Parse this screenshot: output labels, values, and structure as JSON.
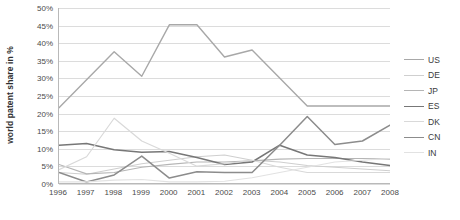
{
  "chart_data": {
    "type": "line",
    "title": "",
    "xlabel": "",
    "ylabel": "world patent share in %",
    "x": [
      1996,
      1997,
      1998,
      1999,
      2000,
      2001,
      2002,
      2003,
      2004,
      2005,
      2006,
      2007,
      2008
    ],
    "categories": [
      "1996",
      "1997",
      "1998",
      "1999",
      "2000",
      "2001",
      "2002",
      "2003",
      "2004",
      "2005",
      "2006",
      "2007",
      "2008"
    ],
    "ylim": [
      0,
      50
    ],
    "yticks": [
      0,
      5,
      10,
      15,
      20,
      25,
      30,
      35,
      40,
      45,
      50
    ],
    "ytick_labels": [
      "0%",
      "5%",
      "10%",
      "15%",
      "20%",
      "25%",
      "30%",
      "35%",
      "40%",
      "45%",
      "50%"
    ],
    "grid": true,
    "legend_position": "right",
    "series": [
      {
        "name": "US",
        "color": "#a8a8a8",
        "width": 1.4,
        "values": [
          21.5,
          29.5,
          37.5,
          30.5,
          45.2,
          45.2,
          36.0,
          38.0,
          30.0,
          22.0,
          22.0,
          22.0,
          22.0
        ]
      },
      {
        "name": "DE",
        "color": "#cfcfcf",
        "width": 1.2,
        "values": [
          3.0,
          2.5,
          4.0,
          5.5,
          6.5,
          7.5,
          8.0,
          6.5,
          6.0,
          5.0,
          4.5,
          4.0,
          3.5
        ]
      },
      {
        "name": "JP",
        "color": "#b5b5b5",
        "width": 1.2,
        "values": [
          5.3,
          2.6,
          3.0,
          4.5,
          5.3,
          6.0,
          6.0,
          6.3,
          6.8,
          7.0,
          7.0,
          7.0,
          6.8
        ]
      },
      {
        "name": "ES",
        "color": "#777777",
        "width": 1.5,
        "values": [
          10.8,
          11.3,
          9.5,
          8.8,
          9.0,
          7.3,
          5.3,
          6.0,
          10.8,
          8.0,
          7.3,
          6.0,
          5.0
        ]
      },
      {
        "name": "DK",
        "color": "#d9d9d9",
        "width": 1.2,
        "values": [
          3.8,
          7.5,
          18.5,
          12.0,
          8.5,
          4.8,
          5.5,
          6.5,
          4.5,
          3.0,
          3.0,
          3.0,
          3.0
        ]
      },
      {
        "name": "CN",
        "color": "#8c8c8c",
        "width": 1.5,
        "values": [
          3.0,
          0.3,
          2.3,
          7.7,
          1.4,
          3.2,
          3.0,
          3.0,
          10.8,
          19.0,
          11.0,
          12.0,
          16.5
        ]
      },
      {
        "name": "IN",
        "color": "#e2e2e2",
        "width": 1.2,
        "values": [
          0.3,
          0.3,
          0.8,
          1.0,
          0.3,
          0.3,
          0.5,
          1.5,
          3.0,
          4.5,
          6.0,
          6.5,
          7.0
        ]
      }
    ]
  },
  "legend": {
    "items": [
      {
        "label": "US"
      },
      {
        "label": "DE"
      },
      {
        "label": "JP"
      },
      {
        "label": "ES"
      },
      {
        "label": "DK"
      },
      {
        "label": "CN"
      },
      {
        "label": "IN"
      }
    ]
  }
}
